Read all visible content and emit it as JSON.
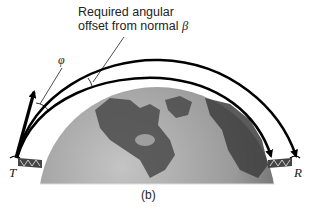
{
  "annotation": {
    "line1": "Required angular",
    "line2": "offset from normal",
    "symbol": "β"
  },
  "phi_label": "φ",
  "transmitter_label": "T",
  "receiver_label": "R",
  "caption": "(b)",
  "colors": {
    "globe_light": "#b8b8b8",
    "globe_dark": "#5a5a5a",
    "land": "#4a4a4a",
    "arrows": "#000000"
  }
}
